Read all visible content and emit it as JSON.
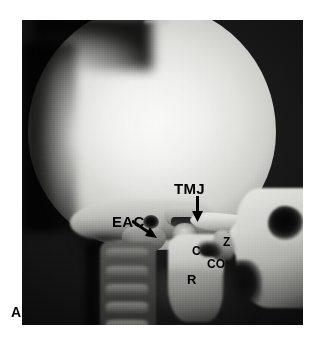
{
  "figure": {
    "panel_label": "A",
    "modality": "lateral skull radiograph",
    "frame": {
      "x": 22,
      "y": 20,
      "width": 281,
      "height": 305
    }
  },
  "colors": {
    "page_background": "#ffffff",
    "film_background": "#0b0b0b",
    "bone_bright": "#f0f0ee",
    "annotation_text": "#000000",
    "arrow": "#000000"
  },
  "annotations": [
    {
      "id": "tmj",
      "label": "TMJ",
      "meaning": "temporomandibular joint",
      "icon": "down-arrow-icon",
      "has_arrow": true,
      "arrow_direction": "down"
    },
    {
      "id": "eac",
      "label": "EAC",
      "meaning": "external auditory canal",
      "icon": "diagonal-arrow-icon",
      "has_arrow": true,
      "arrow_direction": "down-right"
    },
    {
      "id": "c",
      "label": "C",
      "meaning": "condyle",
      "has_arrow": false
    },
    {
      "id": "z",
      "label": "Z",
      "meaning": "zygomatic arch",
      "has_arrow": false
    },
    {
      "id": "co",
      "label": "CO",
      "meaning": "coronoid process",
      "has_arrow": false
    },
    {
      "id": "r",
      "label": "R",
      "meaning": "ramus of mandible",
      "has_arrow": false
    }
  ],
  "anatomy_regions": [
    {
      "id": "cranial-vault",
      "name": "cranial vault"
    },
    {
      "id": "temporal-base",
      "name": "temporal bone / skull base"
    },
    {
      "id": "eac-canal",
      "name": "external auditory canal"
    },
    {
      "id": "mastoid",
      "name": "mastoid process"
    },
    {
      "id": "glenoid-fossa",
      "name": "glenoid fossa"
    },
    {
      "id": "condyle",
      "name": "mandibular condyle"
    },
    {
      "id": "zygomatic-arch",
      "name": "zygomatic arch"
    },
    {
      "id": "ramus",
      "name": "mandibular ramus"
    },
    {
      "id": "coronoid",
      "name": "coronoid process"
    },
    {
      "id": "orbit-socket",
      "name": "orbit"
    },
    {
      "id": "maxilla",
      "name": "maxilla"
    },
    {
      "id": "cervical-spine",
      "name": "cervical spine"
    }
  ]
}
